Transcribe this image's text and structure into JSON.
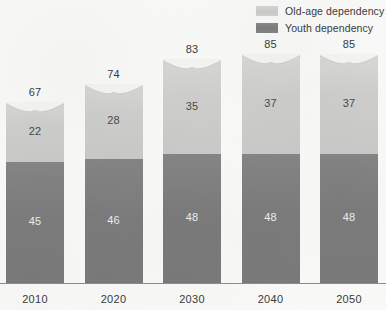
{
  "legend": {
    "position": "top-right",
    "items": [
      {
        "label": "Old-age dependency",
        "key": "old_age",
        "color": "#cececd"
      },
      {
        "label": "Youth dependency",
        "key": "youth",
        "color": "#7c7c7d"
      }
    ]
  },
  "chart_data": {
    "type": "bar",
    "stacked": true,
    "title": "",
    "subtitle": "",
    "xlabel": "",
    "ylabel": "",
    "grid": false,
    "legend_position": "top-right",
    "categories": [
      "2010",
      "2020",
      "2030",
      "2040",
      "2050"
    ],
    "series": [
      {
        "name": "Youth dependency",
        "color": "#7c7c7d",
        "values": [
          45,
          46,
          48,
          48,
          48
        ]
      },
      {
        "name": "Old-age dependency",
        "color": "#cececd",
        "values": [
          22,
          28,
          35,
          37,
          37
        ]
      }
    ],
    "totals": [
      67,
      74,
      83,
      85,
      85
    ],
    "ylim": [
      0,
      95
    ],
    "value_labels_shown": true,
    "total_labels_shown": true
  }
}
